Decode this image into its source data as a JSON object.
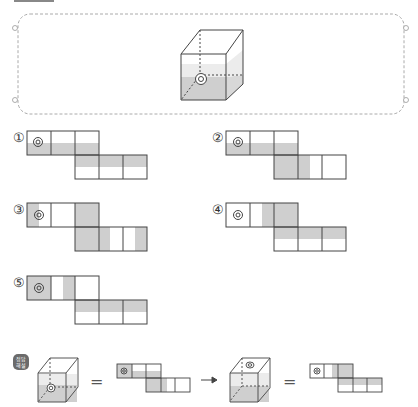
{
  "problem": {
    "frame": "dashed-rounded-box",
    "cube": {
      "mark": "double-circle",
      "shaded_face": "front-lower-half",
      "shade_color": "#cfcfcf"
    }
  },
  "options": [
    {
      "label": "①",
      "id": "1"
    },
    {
      "label": "②",
      "id": "2"
    },
    {
      "label": "③",
      "id": "3"
    },
    {
      "label": "④",
      "id": "4"
    },
    {
      "label": "⑤",
      "id": "5"
    }
  ],
  "hint": {
    "badge": "정답\n해설",
    "equals_1": "=",
    "arrow": "→",
    "equals_2": "="
  },
  "colors": {
    "line": "#444444",
    "shade": "#cfcfcf",
    "dash": "#aaaaaa"
  }
}
